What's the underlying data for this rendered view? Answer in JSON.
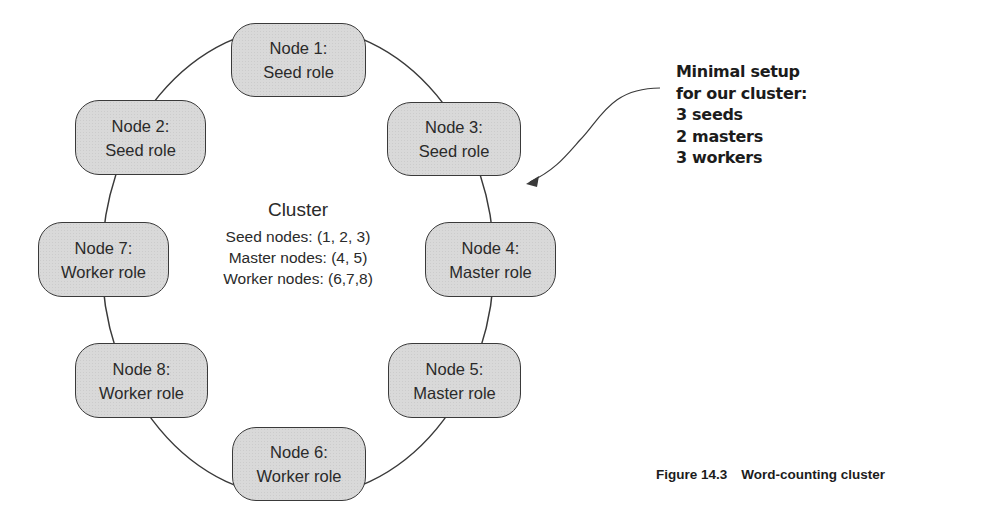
{
  "diagram": {
    "type": "ring-cluster",
    "center": {
      "title": "Cluster",
      "lines": [
        "Seed nodes: (1, 2, 3)",
        "Master nodes: (4, 5)",
        "Worker nodes: (6,7,8)"
      ]
    },
    "nodes": [
      {
        "id": "node-1",
        "name": "Node 1:",
        "role": "Seed role"
      },
      {
        "id": "node-2",
        "name": "Node 2:",
        "role": "Seed role"
      },
      {
        "id": "node-3",
        "name": "Node 3:",
        "role": "Seed role"
      },
      {
        "id": "node-7",
        "name": "Node 7:",
        "role": "Worker role"
      },
      {
        "id": "node-4",
        "name": "Node 4:",
        "role": "Master role"
      },
      {
        "id": "node-8",
        "name": "Node 8:",
        "role": "Worker role"
      },
      {
        "id": "node-5",
        "name": "Node 5:",
        "role": "Master role"
      },
      {
        "id": "node-6",
        "name": "Node 6:",
        "role": "Worker role"
      }
    ],
    "annotation": {
      "lines": [
        "Minimal setup",
        "for our cluster:",
        "3 seeds",
        "2 masters",
        "3 workers"
      ]
    },
    "colors": {
      "node_fill": "#d9d9d9",
      "node_border": "#3a3a3a",
      "ring_line": "#3a3a3a",
      "text": "#2a2a2a"
    }
  },
  "caption": {
    "label": "Figure 14.3",
    "title": "Word-counting cluster"
  }
}
